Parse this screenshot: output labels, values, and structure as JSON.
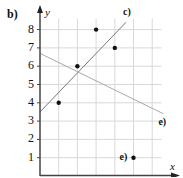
{
  "figure": {
    "part_label": "b)"
  },
  "chart_data": {
    "type": "scatter",
    "title": "",
    "xlabel": "x",
    "ylabel": "y",
    "xlim": [
      0,
      7
    ],
    "ylim": [
      0,
      8.5
    ],
    "grid": true,
    "y_tick_labels": [
      "1",
      "2",
      "3",
      "4",
      "5",
      "6",
      "7",
      "8"
    ],
    "x_tick_labels": [],
    "points": [
      {
        "x": 1,
        "y": 4
      },
      {
        "x": 2,
        "y": 6
      },
      {
        "x": 3,
        "y": 8
      },
      {
        "x": 4,
        "y": 7
      },
      {
        "x": 5,
        "y": 1
      }
    ],
    "annotated_point": {
      "x": 5,
      "y": 1,
      "label": "e)"
    },
    "lines": [
      {
        "name": "c)",
        "x_start": 0,
        "y_start": 3.5,
        "x_end": 4.6,
        "y_end": 8.4,
        "color": "#777777"
      },
      {
        "name": "e)",
        "x_start": 0,
        "y_start": 6.7,
        "x_end": 6.6,
        "y_end": 3.4,
        "color": "#aaaaaa"
      }
    ]
  }
}
